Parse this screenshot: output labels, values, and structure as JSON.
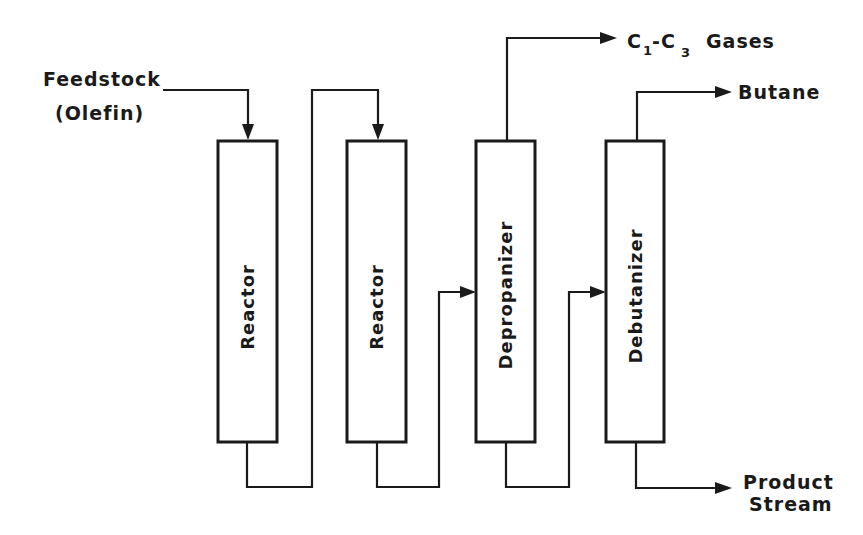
{
  "diagram": {
    "type": "process-flow",
    "inputs": {
      "feedstock_line1": "Feedstock",
      "feedstock_line2": "(Olefin)"
    },
    "units": [
      {
        "id": "reactor-1",
        "label": "Reactor"
      },
      {
        "id": "reactor-2",
        "label": "Reactor"
      },
      {
        "id": "depropanizer",
        "label": "Depropanizer"
      },
      {
        "id": "debutanizer",
        "label": "Debutanizer"
      }
    ],
    "outputs": {
      "gases_c1": "C",
      "gases_sub1": "1",
      "gases_dash": "-C",
      "gases_sub3": "3",
      "gases_word": "Gases",
      "gases_full": "C1-C3 Gases",
      "butane": "Butane",
      "product_line1": "Product",
      "product_line2": "Stream"
    },
    "flows": [
      {
        "from": "Feedstock (Olefin)",
        "to": "reactor-1",
        "entry": "top"
      },
      {
        "from": "reactor-1",
        "to": "reactor-2",
        "exit": "bottom",
        "entry": "top"
      },
      {
        "from": "reactor-2",
        "to": "depropanizer",
        "exit": "bottom",
        "entry": "side"
      },
      {
        "from": "depropanizer",
        "to": "C1-C3 Gases",
        "exit": "top"
      },
      {
        "from": "depropanizer",
        "to": "debutanizer",
        "exit": "bottom",
        "entry": "side"
      },
      {
        "from": "debutanizer",
        "to": "Butane",
        "exit": "top"
      },
      {
        "from": "debutanizer",
        "to": "Product Stream",
        "exit": "bottom"
      }
    ],
    "colors": {
      "line": "#1a1a1a",
      "background": "#ffffff"
    }
  }
}
